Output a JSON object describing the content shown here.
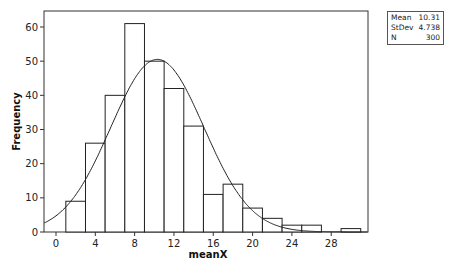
{
  "chart_data": {
    "type": "bar",
    "subtype": "histogram_with_normal_fit",
    "title": "",
    "xlabel": "meanX",
    "ylabel": "Frequency",
    "xlim": [
      -1.2,
      31.8
    ],
    "ylim": [
      0,
      65
    ],
    "x_ticks": [
      0,
      4,
      8,
      12,
      16,
      20,
      24,
      28
    ],
    "y_ticks": [
      0,
      10,
      20,
      30,
      40,
      50,
      60
    ],
    "grid": false,
    "bin_width": 2,
    "bins": [
      {
        "start": 1,
        "end": 3,
        "count": 9
      },
      {
        "start": 3,
        "end": 5,
        "count": 26
      },
      {
        "start": 5,
        "end": 7,
        "count": 40
      },
      {
        "start": 7,
        "end": 9,
        "count": 61
      },
      {
        "start": 9,
        "end": 11,
        "count": 50
      },
      {
        "start": 11,
        "end": 13,
        "count": 42
      },
      {
        "start": 13,
        "end": 15,
        "count": 31
      },
      {
        "start": 15,
        "end": 17,
        "count": 11
      },
      {
        "start": 17,
        "end": 19,
        "count": 14
      },
      {
        "start": 19,
        "end": 21,
        "count": 7
      },
      {
        "start": 21,
        "end": 23,
        "count": 4
      },
      {
        "start": 23,
        "end": 25,
        "count": 2
      },
      {
        "start": 25,
        "end": 27,
        "count": 2
      },
      {
        "start": 29,
        "end": 31,
        "count": 1
      }
    ],
    "normal_fit": {
      "mean": 10.31,
      "stdev": 4.738,
      "n": 300
    },
    "legend": {
      "position": "top-right outside",
      "entries": [
        {
          "label": "Mean",
          "value": "10.31"
        },
        {
          "label": "StDev",
          "value": "4.738"
        },
        {
          "label": "N",
          "value": "300"
        }
      ]
    }
  },
  "stats": {
    "mean_label": "Mean",
    "mean_value": "10.31",
    "stdev_label": "StDev",
    "stdev_value": "4.738",
    "n_label": "N",
    "n_value": "300"
  }
}
